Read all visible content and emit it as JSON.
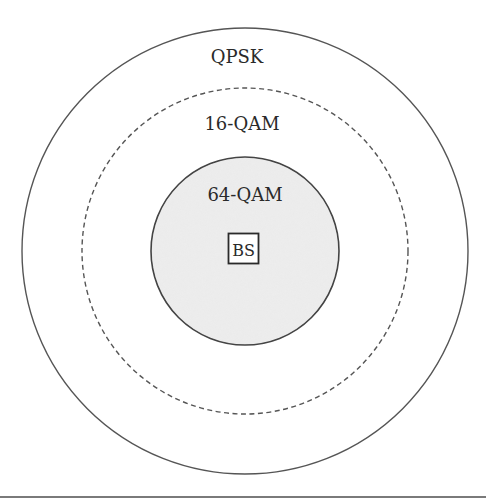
{
  "diagram": {
    "center": {
      "x": 245,
      "y": 251
    },
    "zones": [
      {
        "id": "qpsk",
        "label": "QPSK",
        "radius": 223,
        "line_style": "solid",
        "fill": "none",
        "label_y": 63
      },
      {
        "id": "16qam",
        "label": "16-QAM",
        "radius": 163,
        "line_style": "dashed",
        "fill": "none",
        "label_y": 130
      },
      {
        "id": "64qam",
        "label": "64-QAM",
        "radius": 94,
        "line_style": "solid",
        "fill": "#e9e9e9",
        "label_y": 201
      }
    ],
    "base_station": {
      "label": "BS",
      "box_size": 30
    },
    "colors": {
      "stroke": "#555555",
      "inner_fill": "#e9e9e9",
      "text": "#2a2a2a",
      "rule": "#7a7a7a",
      "background": "#ffffff"
    }
  }
}
